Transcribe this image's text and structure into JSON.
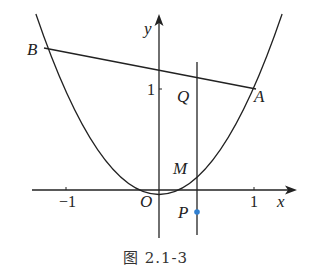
{
  "figure": {
    "caption": "图 2.1-3",
    "axes": {
      "x_label": "x",
      "y_label": "y",
      "origin_label": "O"
    },
    "ticks": {
      "x_neg1": "−1",
      "x_pos1": "1",
      "y_pos1": "1"
    },
    "points": {
      "A": "A",
      "B": "B",
      "Q": "Q",
      "M": "M",
      "P": "P"
    },
    "colors": {
      "line": "#222222",
      "point_P": "#2f7fd0"
    },
    "curve": "y = x^2 (parabola)"
  }
}
